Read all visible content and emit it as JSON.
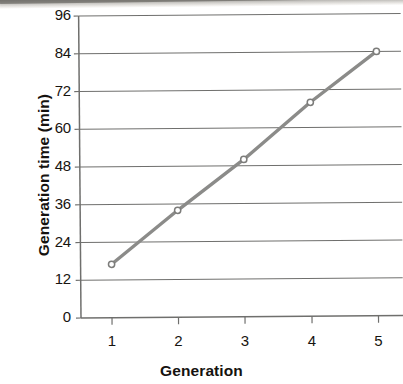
{
  "figure": {
    "background_color": "#ffffff",
    "ink_color": "#17140f",
    "line_color": "#8b8b89",
    "axis_color": "#6f6f6d"
  },
  "chart_data": {
    "type": "line",
    "title": "",
    "xlabel": "Generation",
    "ylabel": "Generation time (min)",
    "x": [
      1,
      2,
      3,
      4,
      5
    ],
    "values": [
      17,
      34,
      50,
      68,
      84
    ],
    "series": [
      {
        "name": "Generation time",
        "values": [
          17,
          34,
          50,
          68,
          84
        ]
      }
    ],
    "xlim": [
      0.5,
      5.5
    ],
    "ylim": [
      0,
      96
    ],
    "xticks": [
      "1",
      "2",
      "3",
      "4",
      "5"
    ],
    "yticks": [
      "0",
      "12",
      "24",
      "36",
      "48",
      "60",
      "72",
      "84",
      "96"
    ],
    "ytick_values": [
      0,
      12,
      24,
      36,
      48,
      60,
      72,
      84,
      96
    ],
    "ystep": 12,
    "grid": "horizontal",
    "legend": "none",
    "marker": "open-circle",
    "line_style": "solid",
    "annotations": []
  }
}
